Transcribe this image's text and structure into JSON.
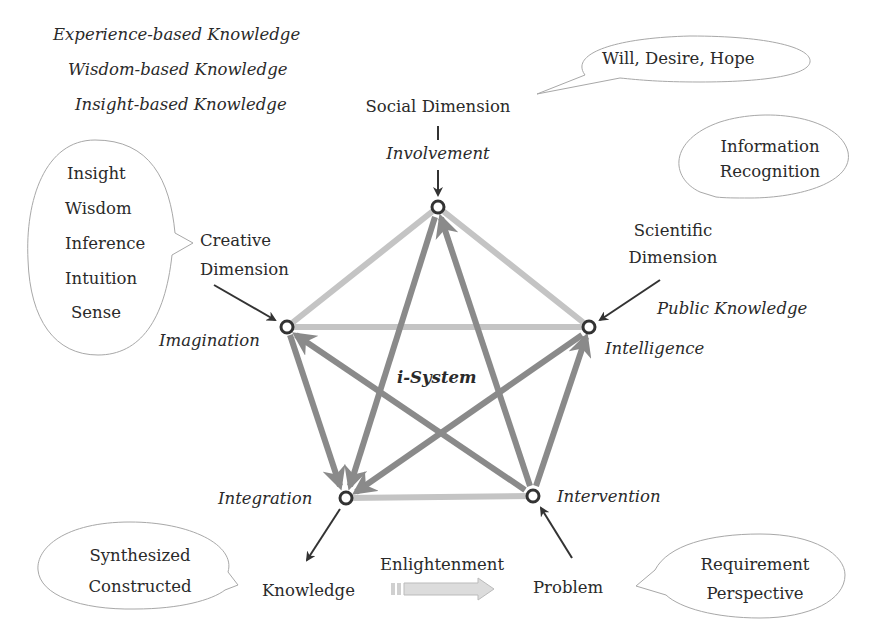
{
  "knowledge_types": [
    "Experience-based Knowledge",
    "Wisdom-based Knowledge",
    "Insight-based Knowledge"
  ],
  "bubbles": {
    "will": "Will, Desire, Hope",
    "information": [
      "Information",
      "Recognition"
    ],
    "creative_list": [
      "Insight",
      "Wisdom",
      "Inference",
      "Intuition",
      "Sense"
    ],
    "synthesized": [
      "Synthesized",
      "Constructed"
    ],
    "requirement": [
      "Requirement",
      "Perspective"
    ]
  },
  "dimensions": {
    "social": "Social Dimension",
    "creative": [
      "Creative",
      "Dimension"
    ],
    "scientific": [
      "Scientific",
      "Dimension"
    ]
  },
  "nodes": {
    "involvement": "Involvement",
    "imagination": "Imagination",
    "intelligence": "Intelligence",
    "integration": "Integration",
    "intervention": "Intervention"
  },
  "center_label": "i-System",
  "public_knowledge": "Public Knowledge",
  "bottom": {
    "knowledge": "Knowledge",
    "enlightenment": "Enlightenment",
    "problem": "Problem"
  },
  "colors": {
    "dark_arrow": "#8a8a8a",
    "light_edge": "#c4c4c4",
    "node_stroke": "#333333",
    "pointer": "#333333",
    "bubble_stroke": "#a8a8a8"
  }
}
